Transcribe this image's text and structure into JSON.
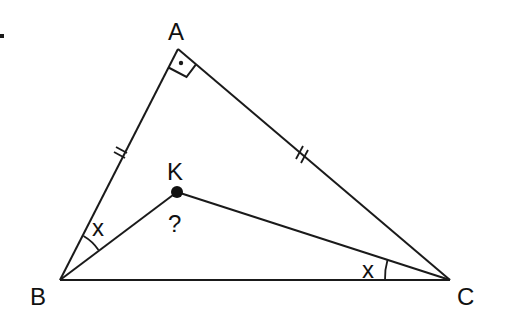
{
  "diagram": {
    "type": "geometry-triangle",
    "points": {
      "A": {
        "label": "A",
        "x": 178,
        "y": 49
      },
      "B": {
        "label": "B",
        "x": 60,
        "y": 280
      },
      "C": {
        "label": "C",
        "x": 450,
        "y": 280
      },
      "K": {
        "label": "K",
        "x": 177,
        "y": 192
      }
    },
    "segments": [
      "AB",
      "AC",
      "BC",
      "BK",
      "KC"
    ],
    "right_angle_at": "A",
    "equal_sides": [
      "AB",
      "AC"
    ],
    "angle_labels": {
      "ABK": "x",
      "KCB": "x",
      "BKC": "?"
    },
    "marker_dot": "•"
  },
  "labels": {
    "A": "A",
    "B": "B",
    "C": "C",
    "K": "K",
    "angle_B": "x",
    "angle_C": "x",
    "unknown": "?"
  },
  "colors": {
    "stroke": "#1a1a1a",
    "background": "#ffffff"
  }
}
